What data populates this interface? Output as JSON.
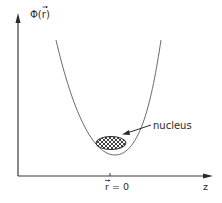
{
  "diagram": {
    "y_axis_label": "Φ(r⃗)",
    "y_axis_label_main": "Φ(",
    "y_axis_label_var": "r",
    "y_axis_label_close": ")",
    "x_axis_label": "z",
    "origin_label_var": "r",
    "origin_label_rest": " = 0",
    "annotation": "nucleus",
    "colors": {
      "axis": "#3a3a3a",
      "curve": "#6a6a6a",
      "text": "#2a2a2a",
      "hatch": "#2a2a2a",
      "background": "#ffffff"
    }
  }
}
